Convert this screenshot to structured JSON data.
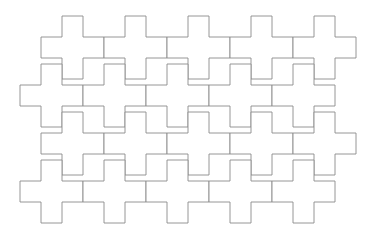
{
  "figure": {
    "type": "geometric-tiling-diagram",
    "background_color": "#ffffff",
    "stroke_color": "#8a8a8a",
    "fill_color": "#ffffff",
    "stroke_width": 0.9,
    "canvas": {
      "width": 391,
      "height": 242
    },
    "tile": {
      "shape_name": "plus-cross",
      "description": "Greek cross (plus sign) polygon made of five equal squares",
      "cell_size": 21,
      "span": 63,
      "arm_count": 4,
      "vertex_count": 12
    },
    "tiling": {
      "pattern": "interlocking offset cross tessellation",
      "row_count": 5,
      "column_counts": [
        5,
        5,
        5,
        5,
        5
      ],
      "tile_count": 25,
      "column_step_x": 63,
      "row_step_y": 48,
      "row_offset_x": -21,
      "origin_x": 41,
      "origin_y": 16,
      "bounds": {
        "left": 24,
        "top": 16,
        "right": 373,
        "bottom": 230
      }
    },
    "rows": [
      {
        "index": 0,
        "start_x": 41,
        "y": 16,
        "count": 5
      },
      {
        "index": 1,
        "start_x": 20,
        "y": 64,
        "count": 5
      },
      {
        "index": 2,
        "start_x": 62,
        "y": 64,
        "count": 0
      },
      {
        "index": 3,
        "start_x": 41,
        "y": 112,
        "count": 5
      },
      {
        "index": 4,
        "start_x": 20,
        "y": 160,
        "count": 5
      },
      {
        "index": 5,
        "start_x": 41,
        "y": 208,
        "count": 0
      }
    ]
  }
}
